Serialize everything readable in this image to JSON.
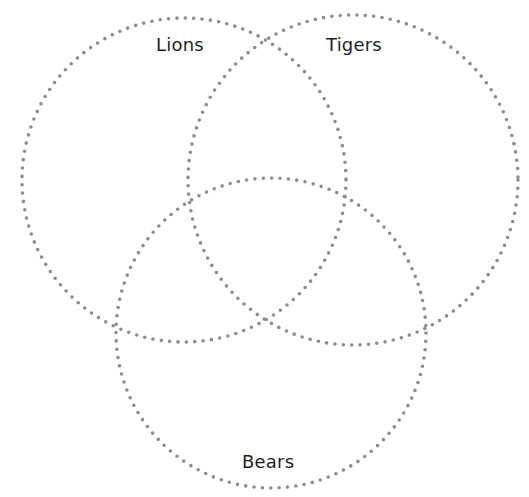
{
  "diagram": {
    "type": "venn",
    "sets": [
      {
        "id": "lions",
        "label": "Lions",
        "cx": 184,
        "cy": 180,
        "r": 162
      },
      {
        "id": "tigers",
        "label": "Tigers",
        "cx": 353,
        "cy": 180,
        "r": 165
      },
      {
        "id": "bears",
        "label": "Bears",
        "cx": 271,
        "cy": 333,
        "r": 155
      }
    ],
    "style": {
      "stroke_color": "#8c8c8c",
      "stroke_style": "dotted",
      "text_color": "#1e1e1e",
      "background": "#ffffff"
    }
  }
}
